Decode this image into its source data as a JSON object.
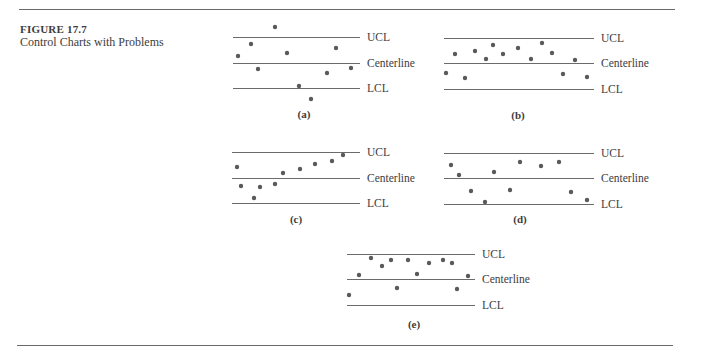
{
  "figure": {
    "number": "FIGURE 17.7",
    "title": "Control Charts with Problems"
  },
  "line_labels": {
    "ucl": "UCL",
    "center": "Centerline",
    "lcl": "LCL"
  },
  "chart_data": [
    {
      "type": "scatter",
      "panel": "(a)",
      "title": "",
      "description": "Points outside control limits (above UCL and below LCL)",
      "limits": {
        "UCL": 37,
        "Centerline": 63,
        "LCL": 88
      },
      "line_x": [
        233,
        360
      ],
      "points": [
        [
          238,
          56
        ],
        [
          251,
          44
        ],
        [
          258,
          69
        ],
        [
          275,
          27
        ],
        [
          287,
          53
        ],
        [
          299,
          86
        ],
        [
          311,
          99
        ],
        [
          327,
          73
        ],
        [
          336,
          48
        ],
        [
          351,
          68
        ]
      ],
      "label_pos": [
        304,
        118
      ]
    },
    {
      "type": "scatter",
      "panel": "(b)",
      "title": "",
      "description": "Too many points above the centerline (run)",
      "limits": {
        "UCL": 38,
        "Centerline": 63,
        "LCL": 89
      },
      "line_x": [
        444,
        594
      ],
      "points": [
        [
          446,
          73
        ],
        [
          455,
          54
        ],
        [
          465,
          78
        ],
        [
          475,
          51
        ],
        [
          486,
          59
        ],
        [
          493,
          45
        ],
        [
          503,
          54
        ],
        [
          518,
          48
        ],
        [
          531,
          59
        ],
        [
          542,
          43
        ],
        [
          552,
          53
        ],
        [
          563,
          74
        ],
        [
          575,
          60
        ],
        [
          587,
          77
        ]
      ],
      "label_pos": [
        518,
        119
      ]
    },
    {
      "type": "scatter",
      "panel": "(c)",
      "title": "",
      "description": "Upward trend",
      "limits": {
        "UCL": 152,
        "Centerline": 178,
        "LCL": 203
      },
      "line_x": [
        232,
        360
      ],
      "points": [
        [
          237,
          167
        ],
        [
          241,
          186
        ],
        [
          254,
          198
        ],
        [
          260,
          187
        ],
        [
          275,
          184
        ],
        [
          283,
          173
        ],
        [
          300,
          169
        ],
        [
          315,
          164
        ],
        [
          332,
          161
        ],
        [
          343,
          155
        ]
      ],
      "label_pos": [
        296,
        223
      ]
    },
    {
      "type": "scatter",
      "panel": "(d)",
      "title": "",
      "description": "Points alternating near control limits (cyclic / hugging limits)",
      "limits": {
        "UCL": 153,
        "Centerline": 178,
        "LCL": 204
      },
      "line_x": [
        444,
        594
      ],
      "points": [
        [
          451,
          165
        ],
        [
          459,
          175
        ],
        [
          471,
          191
        ],
        [
          485,
          202
        ],
        [
          494,
          172
        ],
        [
          510,
          190
        ],
        [
          520,
          162
        ],
        [
          541,
          166
        ],
        [
          559,
          162
        ],
        [
          571,
          192
        ],
        [
          587,
          200
        ]
      ],
      "label_pos": [
        520,
        223
      ]
    },
    {
      "type": "scatter",
      "panel": "(e)",
      "title": "",
      "description": "Too many points near the UCL",
      "limits": {
        "UCL": 254,
        "Centerline": 279,
        "LCL": 305
      },
      "line_x": [
        347,
        475
      ],
      "points": [
        [
          349,
          295
        ],
        [
          359,
          275
        ],
        [
          371,
          258
        ],
        [
          382,
          266
        ],
        [
          391,
          260
        ],
        [
          397,
          288
        ],
        [
          408,
          260
        ],
        [
          417,
          274
        ],
        [
          429,
          263
        ],
        [
          443,
          260
        ],
        [
          452,
          263
        ],
        [
          457,
          289
        ],
        [
          468,
          276
        ]
      ],
      "label_pos": [
        414,
        328
      ]
    }
  ]
}
